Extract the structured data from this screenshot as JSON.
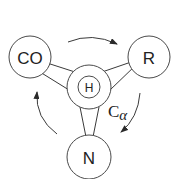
{
  "diagram": {
    "title": "",
    "center": {
      "label": "H",
      "annotation_main": "C",
      "annotation_sub": "α"
    },
    "groups": [
      {
        "id": "co",
        "label": "CO"
      },
      {
        "id": "r",
        "label": "R"
      },
      {
        "id": "n",
        "label": "N"
      }
    ],
    "rotation": "clockwise: CO → R → N → CO",
    "colors": {
      "stroke": "#3a3a3a",
      "text": "#222222",
      "background": "#ffffff"
    }
  }
}
